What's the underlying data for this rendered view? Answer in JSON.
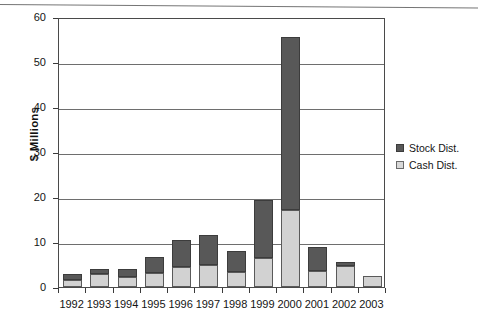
{
  "chart_data": {
    "type": "bar",
    "subtype": "stacked-vertical",
    "title": "",
    "xlabel": "",
    "ylabel": "$ Millions",
    "ylim": [
      0,
      60
    ],
    "yticks": [
      0,
      10,
      20,
      30,
      40,
      50,
      60
    ],
    "ytick_labels": [
      "0",
      "10",
      "20",
      "30",
      "40",
      "50",
      "60"
    ],
    "grid": true,
    "grid_axis": "y",
    "legend_position": "right",
    "categories": [
      "1992",
      "1993",
      "1994",
      "1995",
      "1996",
      "1997",
      "1998",
      "1999",
      "2000",
      "2001",
      "2002",
      "2003"
    ],
    "series": [
      {
        "name": "Cash Dist.",
        "color": "#d2d2d2",
        "values": [
          1.5,
          2.9,
          2.3,
          3.2,
          4.4,
          5.0,
          3.4,
          6.5,
          17.1,
          3.5,
          4.7,
          2.4
        ]
      },
      {
        "name": "Stock Dist.",
        "color": "#585858",
        "values": [
          1.4,
          1.2,
          1.6,
          3.4,
          6.0,
          6.5,
          4.7,
          12.8,
          38.4,
          5.4,
          0.8,
          0.0
        ]
      }
    ],
    "totals": [
      2.9,
      4.1,
      3.9,
      6.6,
      10.4,
      11.5,
      8.1,
      19.3,
      55.5,
      8.9,
      5.5,
      2.4
    ]
  },
  "legend": {
    "entries": [
      {
        "label": "Stock Dist.",
        "swatch": "stock-swatch"
      },
      {
        "label": "Cash Dist.",
        "swatch": "cash-swatch"
      }
    ]
  },
  "axis": {
    "y_title": "$ Millions"
  }
}
